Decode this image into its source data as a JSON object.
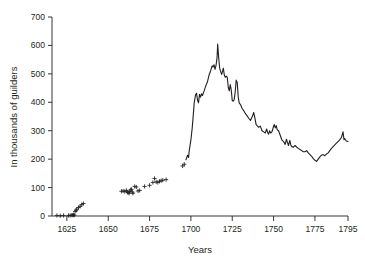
{
  "chart_data": {
    "type": "line",
    "title": "",
    "subtitle": "",
    "xlabel": "Years",
    "ylabel": "In thousands of guilders",
    "xlim": [
      1616,
      1795
    ],
    "ylim": [
      0,
      700
    ],
    "grid": false,
    "legend": null,
    "xticks": [
      1625,
      1650,
      1675,
      1700,
      1725,
      1750,
      1775,
      1795
    ],
    "xtick_labels": [
      "1625",
      "1650",
      "1675",
      "1700",
      "1725",
      "1750",
      "1775",
      "1795"
    ],
    "yticks": [
      0,
      100,
      200,
      300,
      400,
      500,
      600,
      700
    ],
    "ytick_labels": [
      "0",
      "100",
      "200",
      "300",
      "400",
      "500",
      "600",
      "700"
    ],
    "series": [
      {
        "name": "scatter-observations",
        "marker": "plus",
        "mode": "markers",
        "points": [
          [
            1619,
            2
          ],
          [
            1621,
            1
          ],
          [
            1623,
            2
          ],
          [
            1626,
            2
          ],
          [
            1627,
            2
          ],
          [
            1628,
            3
          ],
          [
            1628.6,
            3
          ],
          [
            1629,
            4
          ],
          [
            1629.5,
            3
          ],
          [
            1630,
            16
          ],
          [
            1630.6,
            20
          ],
          [
            1631,
            24
          ],
          [
            1632,
            30
          ],
          [
            1633,
            34
          ],
          [
            1634,
            40
          ],
          [
            1635,
            44
          ],
          [
            1658,
            87
          ],
          [
            1659,
            88
          ],
          [
            1660,
            86
          ],
          [
            1661,
            90
          ],
          [
            1661.7,
            84
          ],
          [
            1662,
            82
          ],
          [
            1662.6,
            80
          ],
          [
            1663,
            86
          ],
          [
            1663.6,
            92
          ],
          [
            1664,
            94
          ],
          [
            1664.6,
            84
          ],
          [
            1665,
            80
          ],
          [
            1666,
            104
          ],
          [
            1667,
            102
          ],
          [
            1668,
            88
          ],
          [
            1669,
            90
          ],
          [
            1672,
            104
          ],
          [
            1675,
            108
          ],
          [
            1677,
            118
          ],
          [
            1678,
            132
          ],
          [
            1679,
            120
          ],
          [
            1680,
            118
          ],
          [
            1681,
            122
          ],
          [
            1682,
            124
          ],
          [
            1683,
            126
          ],
          [
            1685,
            128
          ],
          [
            1695,
            176
          ],
          [
            1696,
            182
          ]
        ]
      },
      {
        "name": "annual-series",
        "mode": "line",
        "points": [
          [
            1697,
            198
          ],
          [
            1698,
            214
          ],
          [
            1698.6,
            206
          ],
          [
            1699,
            230
          ],
          [
            1700,
            268
          ],
          [
            1700.8,
            310
          ],
          [
            1701.5,
            360
          ],
          [
            1702,
            398
          ],
          [
            1702.8,
            426
          ],
          [
            1703.4,
            432
          ],
          [
            1704,
            408
          ],
          [
            1704.6,
            398
          ],
          [
            1705.2,
            428
          ],
          [
            1705.8,
            418
          ],
          [
            1706.4,
            430
          ],
          [
            1707,
            424
          ],
          [
            1708,
            440
          ],
          [
            1709,
            458
          ],
          [
            1710,
            472
          ],
          [
            1711,
            496
          ],
          [
            1712,
            512
          ],
          [
            1712.8,
            528
          ],
          [
            1713.4,
            524
          ],
          [
            1714,
            532
          ],
          [
            1714.6,
            516
          ],
          [
            1715.2,
            530
          ],
          [
            1715.8,
            556
          ],
          [
            1716.2,
            605
          ],
          [
            1716.8,
            556
          ],
          [
            1717.4,
            520
          ],
          [
            1718,
            508
          ],
          [
            1718.6,
            498
          ],
          [
            1719,
            506
          ],
          [
            1719.6,
            520
          ],
          [
            1720.2,
            496
          ],
          [
            1720.8,
            488
          ],
          [
            1721.4,
            492
          ],
          [
            1722,
            488
          ],
          [
            1722.6,
            452
          ],
          [
            1723.2,
            440
          ],
          [
            1723.8,
            462
          ],
          [
            1724.4,
            444
          ],
          [
            1725,
            406
          ],
          [
            1725.6,
            404
          ],
          [
            1726.2,
            410
          ],
          [
            1726.8,
            438
          ],
          [
            1727.4,
            478
          ],
          [
            1728,
            470
          ],
          [
            1728.6,
            420
          ],
          [
            1729.2,
            398
          ],
          [
            1730,
            392
          ],
          [
            1731,
            378
          ],
          [
            1732,
            370
          ],
          [
            1733,
            360
          ],
          [
            1734,
            352
          ],
          [
            1735,
            344
          ],
          [
            1736,
            336
          ],
          [
            1737,
            348
          ],
          [
            1738,
            364
          ],
          [
            1738.6,
            348
          ],
          [
            1739.4,
            322
          ],
          [
            1740,
            318
          ],
          [
            1741,
            312
          ],
          [
            1742,
            316
          ],
          [
            1743,
            300
          ],
          [
            1744,
            296
          ],
          [
            1745,
            292
          ],
          [
            1745.8,
            306
          ],
          [
            1746.4,
            294
          ],
          [
            1747,
            288
          ],
          [
            1747.6,
            300
          ],
          [
            1748.2,
            292
          ],
          [
            1749,
            296
          ],
          [
            1749.8,
            312
          ],
          [
            1750.4,
            322
          ],
          [
            1751,
            310
          ],
          [
            1751.6,
            318
          ],
          [
            1752.2,
            304
          ],
          [
            1753,
            300
          ],
          [
            1754,
            284
          ],
          [
            1755,
            268
          ],
          [
            1756,
            262
          ],
          [
            1757,
            252
          ],
          [
            1757.8,
            270
          ],
          [
            1758.4,
            258
          ],
          [
            1759,
            248
          ],
          [
            1759.8,
            266
          ],
          [
            1760.4,
            250
          ],
          [
            1761,
            244
          ],
          [
            1762,
            242
          ],
          [
            1763,
            248
          ],
          [
            1764,
            242
          ],
          [
            1765,
            238
          ],
          [
            1766,
            234
          ],
          [
            1767,
            230
          ],
          [
            1768,
            226
          ],
          [
            1769,
            226
          ],
          [
            1770,
            230
          ],
          [
            1771,
            222
          ],
          [
            1772,
            216
          ],
          [
            1773,
            210
          ],
          [
            1774,
            202
          ],
          [
            1775,
            196
          ],
          [
            1776,
            192
          ],
          [
            1777,
            200
          ],
          [
            1778,
            208
          ],
          [
            1779,
            214
          ],
          [
            1780,
            216
          ],
          [
            1781,
            212
          ],
          [
            1782,
            218
          ],
          [
            1783,
            222
          ],
          [
            1784,
            230
          ],
          [
            1785,
            238
          ],
          [
            1786,
            244
          ],
          [
            1787,
            250
          ],
          [
            1788,
            256
          ],
          [
            1789,
            262
          ],
          [
            1790,
            268
          ],
          [
            1791,
            276
          ],
          [
            1792,
            296
          ],
          [
            1792.6,
            268
          ],
          [
            1793,
            272
          ],
          [
            1794,
            264
          ],
          [
            1795,
            262
          ]
        ]
      }
    ]
  },
  "axes": {
    "y_axis_title": "In thousands of guilders",
    "x_axis_title": "Years"
  }
}
